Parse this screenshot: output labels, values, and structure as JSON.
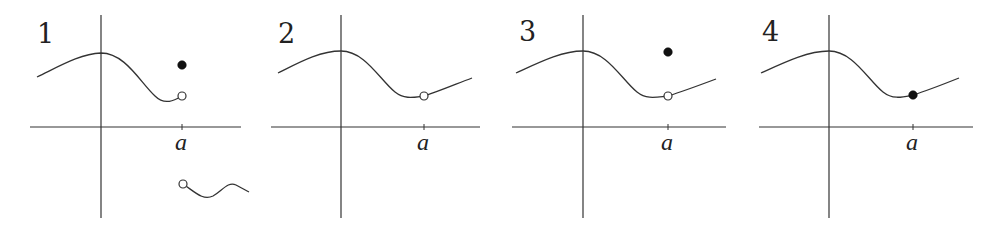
{
  "figure": {
    "stroke_color": "#333333",
    "panels": [
      {
        "number": "1",
        "x_label": "a",
        "origin": [
          101,
          127
        ],
        "axis_x": [
          30,
          241
        ],
        "axis_y": [
          15,
          218
        ],
        "a_x": 182,
        "curve": "M37,77 C60,66 80,54 101,53 C125,53 140,82 155,96 C165,106 175,100 182,96",
        "branch": "M183,184 C195,192 203,201 213,196 C222,191 228,181 236,185 L249,192",
        "open_points": [
          [
            182,
            96
          ],
          [
            183,
            184
          ]
        ],
        "filled_points": [
          [
            182,
            65
          ]
        ],
        "case": "jump discontinuity; f(a) defined elsewhere"
      },
      {
        "number": "2",
        "x_label": "a",
        "origin": [
          341,
          127
        ],
        "axis_x": [
          271,
          480
        ],
        "axis_y": [
          15,
          218
        ],
        "a_x": 424,
        "curve": "M278,73 C300,62 320,51 341,51 C365,51 380,80 395,92 C405,100 415,97 424,96 C440,91 456,84 472,78",
        "branch": "",
        "open_points": [
          [
            424,
            96
          ]
        ],
        "filled_points": [],
        "case": "removable discontinuity; f(a) undefined"
      },
      {
        "number": "3",
        "x_label": "a",
        "origin": [
          583,
          127
        ],
        "axis_x": [
          512,
          726
        ],
        "axis_y": [
          15,
          218
        ],
        "a_x": 668,
        "curve": "M516,73 C540,62 562,51 583,51 C607,51 622,80 637,92 C647,100 657,97 668,96 C684,91 700,85 716,79",
        "branch": "",
        "open_points": [
          [
            668,
            96
          ]
        ],
        "filled_points": [
          [
            668,
            52
          ]
        ],
        "case": "removable discontinuity; f(a) defined but different"
      },
      {
        "number": "4",
        "x_label": "a",
        "origin": [
          829,
          127
        ],
        "axis_x": [
          759,
          973
        ],
        "axis_y": [
          15,
          218
        ],
        "a_x": 913,
        "curve": "M761,73 C785,62 808,51 829,51 C853,51 868,80 883,92 C893,100 903,97 913,95 C929,90 944,84 959,78",
        "branch": "",
        "open_points": [],
        "filled_points": [
          [
            913,
            95
          ]
        ],
        "case": "continuous at a"
      }
    ]
  }
}
